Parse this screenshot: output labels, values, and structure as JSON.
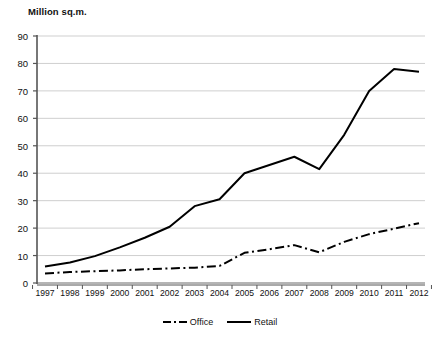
{
  "chart_data": {
    "type": "line",
    "title": "Million sq.m.",
    "xlabel": "",
    "ylabel": "Million sq.m.",
    "ylim": [
      0,
      90
    ],
    "ytick_step": 10,
    "yticks": [
      90,
      80,
      70,
      60,
      50,
      40,
      30,
      20,
      10,
      0
    ],
    "grid": true,
    "legend_position": "bottom-center",
    "categories": [
      "1997",
      "1998",
      "1999",
      "2000",
      "2001",
      "2002",
      "2003",
      "2004",
      "2005",
      "2006",
      "2007",
      "2008",
      "2009",
      "2010",
      "2011",
      "2012"
    ],
    "series": [
      {
        "name": "Office",
        "style": "dash-dot",
        "color": "#000000",
        "values": [
          3.5,
          4.0,
          4.3,
          4.6,
          5.0,
          5.3,
          5.6,
          6.2,
          11.0,
          12.3,
          13.8,
          11.2,
          15.0,
          17.8,
          19.8,
          21.8
        ]
      },
      {
        "name": "Retail",
        "style": "solid",
        "color": "#000000",
        "values": [
          6.0,
          7.5,
          9.8,
          13.0,
          16.5,
          20.5,
          28.0,
          30.5,
          40.0,
          43.0,
          46.0,
          41.5,
          54.0,
          70.0,
          78.0,
          77.0
        ]
      }
    ]
  },
  "legend": {
    "items": [
      {
        "label": "Office",
        "style": "dash-dot"
      },
      {
        "label": "Retail",
        "style": "solid"
      }
    ]
  }
}
